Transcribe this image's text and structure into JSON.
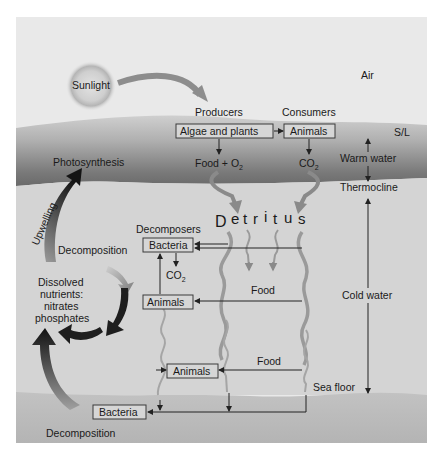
{
  "diagram": {
    "zones": {
      "air": "Air",
      "surface_layer": "S/L",
      "warm_water": "Warm water",
      "thermocline": "Thermocline",
      "cold_water": "Cold water",
      "sea_floor": "Sea floor"
    },
    "sun": {
      "label": "Sunlight"
    },
    "producers": {
      "heading": "Producers",
      "box": "Algae and plants",
      "output_main": "Food + O",
      "output_sub": "2"
    },
    "consumers": {
      "heading": "Consumers",
      "box": "Animals",
      "output_main": "CO",
      "output_sub": "2"
    },
    "detritus": {
      "letters": [
        "D",
        "e",
        "t",
        "r",
        "i",
        "t",
        "u",
        "s"
      ]
    },
    "decomposers": {
      "heading": "Decomposers",
      "bacteria_box": "Bacteria",
      "co2_main": "CO",
      "co2_sub": "2",
      "animals_box": "Animals"
    },
    "food_labels": [
      "Food",
      "Food"
    ],
    "deep_animals_box": "Animals",
    "floor_bacteria_box": "Bacteria",
    "left_cycle": {
      "photosynthesis": "Photosynthesis",
      "upwelling": "Upwelling",
      "decomposition_upper": "Decomposition",
      "nutrients": [
        "Dissolved",
        "nutrients:",
        "nitrates",
        "phosphates"
      ],
      "decomposition_lower": "Decomposition"
    },
    "colors": {
      "air": "#e9e9e9",
      "warm_band": "#8c8c8c",
      "cold_water": "#d3d3d3",
      "sea_floor": "#b9b9b9",
      "box_fill": "#d6d6d6",
      "arrow_dark": "#1e1e1e",
      "arrow_mid": "#7a7a7a",
      "wavy": "#999999"
    }
  }
}
